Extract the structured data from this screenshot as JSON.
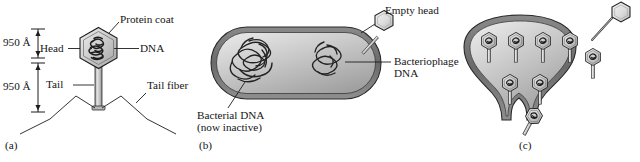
{
  "figure": {
    "background": "#ffffff",
    "ink": "#1d1d1d"
  },
  "panels": [
    {
      "id": "a",
      "caption": "(a)",
      "name": "panel-a-bacteriophage-structure",
      "labels": {
        "protein_coat": "Protein coat",
        "dna": "DNA",
        "head": "Head",
        "tail": "Tail",
        "tail_fiber": "Tail fiber",
        "dim_head": "950 Å",
        "dim_tail": "950 Å"
      }
    },
    {
      "id": "b",
      "caption": "(b)",
      "name": "panel-b-infected-bacterium",
      "labels": {
        "empty_head": "Empty head",
        "bacteriophage_dna_line1": "Bacteriophage",
        "bacteriophage_dna_line2": "DNA",
        "bacterial_dna_line1": "Bacterial DNA",
        "bacterial_dna_line2": "(now inactive)"
      }
    },
    {
      "id": "c",
      "caption": "(c)",
      "name": "panel-c-phage-replication-and-lysis",
      "labels": {},
      "phage_count_inside": 7,
      "phage_count_escaping": 1,
      "empty_head_attached": 1
    }
  ],
  "colors": {
    "head_fill_light": "#e2e2e2",
    "head_fill_mid": "#c3c3c3",
    "head_fill_dark": "#9a9a9a",
    "cell_wall": "#6e6e6e",
    "cell_inner_light": "#d9d9d9",
    "cell_inner_dark": "#9f9f9f",
    "dna_stroke": "#232323",
    "outline": "#1d1d1d"
  }
}
